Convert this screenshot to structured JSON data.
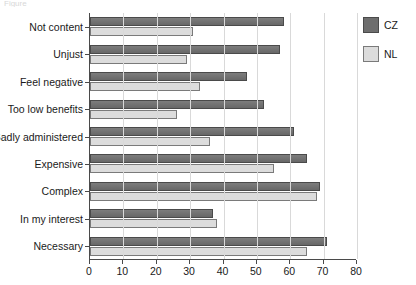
{
  "caption": {
    "clipped_text": "Figure"
  },
  "chart_data": {
    "type": "bar",
    "orientation": "horizontal",
    "title": "",
    "xlabel": "",
    "ylabel": "",
    "xlim": [
      0,
      80
    ],
    "xticks": [
      0,
      10,
      20,
      30,
      40,
      50,
      60,
      70,
      80
    ],
    "xticklabels": [
      "0",
      "10",
      "20",
      "30",
      "40",
      "50",
      "60",
      "70",
      "80"
    ],
    "grid": "vertical",
    "legend_position": "right",
    "categories": [
      "Not content",
      "Unjust",
      "Feel negative",
      "Too low benefits",
      "Badly administered",
      "Expensive",
      "Complex",
      "In my interest",
      "Necessary"
    ],
    "series": [
      {
        "name": "CZ",
        "color": "#6e6e6e",
        "values": [
          58,
          57,
          47,
          52,
          61,
          65,
          69,
          37,
          71
        ]
      },
      {
        "name": "NL",
        "color": "#dcdcdc",
        "values": [
          31,
          29,
          33,
          26,
          36,
          55,
          68,
          38,
          65
        ]
      }
    ]
  },
  "legend": {
    "items": [
      {
        "label": "CZ"
      },
      {
        "label": "NL"
      }
    ]
  }
}
